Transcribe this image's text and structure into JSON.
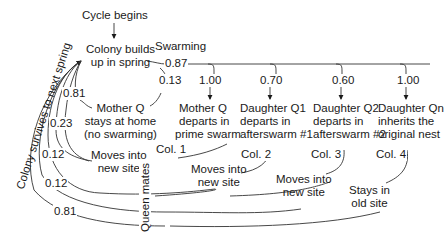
{
  "diagram": {
    "start": "Cycle begins",
    "colony_builds": [
      "Colony builds",
      "up in spring"
    ],
    "swarming_label": "Swarming",
    "swarming_prob": "0.87",
    "no_swarm_prob": "0.13",
    "nodes": {
      "mother_home": [
        "Mother Q",
        "stays at home",
        "(no swarming)"
      ],
      "mother_departs": [
        "Mother Q",
        "departs in",
        "prime swarm"
      ],
      "daughter_q1": [
        "Daughter Q1",
        "departs in",
        "afterswarm #1"
      ],
      "daughter_q2": [
        "Daughter Q2",
        "departs in",
        "afterswarm #2"
      ],
      "daughter_qn": [
        "Daughter Qn",
        "inherits the",
        "original nest"
      ]
    },
    "branch_probs": {
      "mother_departs": "1.00",
      "daughter_q1": "0.70",
      "daughter_q2": "0.60",
      "daughter_qn": "1.00"
    },
    "colonies": [
      "Col. 1",
      "Col. 2",
      "Col. 3",
      "Col. 4"
    ],
    "outcomes": {
      "moves1": [
        "Moves into",
        "new site"
      ],
      "moves2": [
        "Moves into",
        "new site"
      ],
      "moves3": [
        "Moves into",
        "new site"
      ],
      "stays": [
        "Stays in",
        "old site"
      ]
    },
    "survival_probs": [
      "0.81",
      "0.23",
      "0.12",
      "0.12",
      "0.81"
    ],
    "side_label": "Colony survives to next spring",
    "queen_mates": "Queen mates"
  }
}
